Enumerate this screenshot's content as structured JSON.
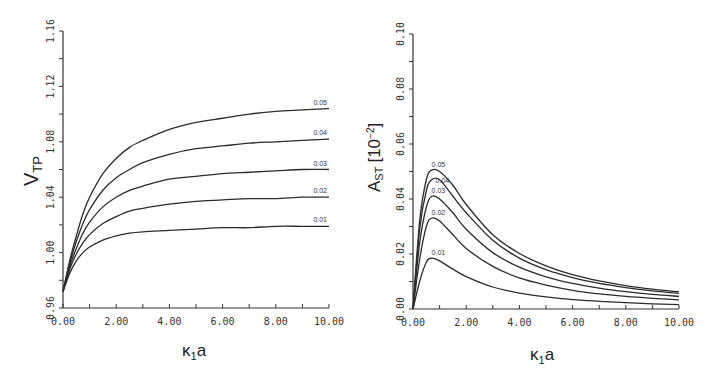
{
  "chart_data": [
    {
      "type": "line",
      "title": "",
      "xlabel": "κ1a",
      "ylabel": "VTP",
      "xlim": [
        0,
        10
      ],
      "ylim": [
        0.96,
        1.16
      ],
      "x_ticks": [
        "0.00",
        "2.00",
        "4.00",
        "6.00",
        "8.00",
        "10.00"
      ],
      "y_ticks": [
        "0.96",
        "1.00",
        "1.04",
        "1.08",
        "1.12",
        "1.16"
      ],
      "grid": false,
      "legend": "inline curve labels at right end",
      "x": [
        0,
        0.25,
        0.5,
        0.75,
        1,
        1.5,
        2,
        2.5,
        3,
        4,
        5,
        6,
        7,
        8,
        9,
        10
      ],
      "series": [
        {
          "name": "0.01",
          "values": [
            0.972,
            0.985,
            0.994,
            1.0,
            1.004,
            1.009,
            1.012,
            1.014,
            1.015,
            1.016,
            1.017,
            1.018,
            1.018,
            1.019,
            1.019,
            1.019
          ]
        },
        {
          "name": "0.02",
          "values": [
            0.972,
            0.988,
            0.999,
            1.007,
            1.013,
            1.021,
            1.026,
            1.03,
            1.032,
            1.035,
            1.037,
            1.038,
            1.039,
            1.039,
            1.04,
            1.04
          ]
        },
        {
          "name": "0.03",
          "values": [
            0.972,
            0.99,
            1.003,
            1.014,
            1.022,
            1.033,
            1.04,
            1.045,
            1.048,
            1.053,
            1.055,
            1.057,
            1.058,
            1.059,
            1.06,
            1.06
          ]
        },
        {
          "name": "0.04",
          "values": [
            0.972,
            0.992,
            1.008,
            1.021,
            1.031,
            1.045,
            1.054,
            1.06,
            1.065,
            1.071,
            1.075,
            1.077,
            1.079,
            1.08,
            1.081,
            1.082
          ]
        },
        {
          "name": "0.05",
          "values": [
            0.972,
            0.994,
            1.012,
            1.028,
            1.04,
            1.057,
            1.068,
            1.076,
            1.081,
            1.089,
            1.094,
            1.097,
            1.1,
            1.102,
            1.103,
            1.104
          ]
        }
      ]
    },
    {
      "type": "line",
      "title": "",
      "xlabel": "κ1a",
      "ylabel": "AST [10^-2]",
      "xlim": [
        0,
        10
      ],
      "ylim": [
        0,
        0.1
      ],
      "x_ticks": [
        "0.00",
        "2.00",
        "4.00",
        "6.00",
        "8.00",
        "10.00"
      ],
      "y_ticks": [
        "0.00",
        "0.02",
        "0.04",
        "0.06",
        "0.08",
        "0.10"
      ],
      "grid": false,
      "legend": "inline curve labels near peaks",
      "x": [
        0,
        0.25,
        0.5,
        0.7,
        1,
        1.5,
        2,
        3,
        4,
        5,
        6,
        7,
        8,
        9,
        10
      ],
      "series": [
        {
          "name": "0.01",
          "values": [
            0,
            0.01,
            0.017,
            0.0185,
            0.0175,
            0.0145,
            0.0118,
            0.008,
            0.0058,
            0.0044,
            0.0034,
            0.0028,
            0.0023,
            0.0019,
            0.0016
          ]
        },
        {
          "name": "0.02",
          "values": [
            0,
            0.018,
            0.03,
            0.033,
            0.032,
            0.027,
            0.022,
            0.0155,
            0.0113,
            0.0087,
            0.0068,
            0.0055,
            0.0046,
            0.0039,
            0.0033
          ]
        },
        {
          "name": "0.03",
          "values": [
            0,
            0.024,
            0.037,
            0.041,
            0.04,
            0.035,
            0.029,
            0.0205,
            0.0152,
            0.0117,
            0.0093,
            0.0076,
            0.0063,
            0.0053,
            0.0046
          ]
        },
        {
          "name": "0.04",
          "values": [
            0,
            0.029,
            0.043,
            0.047,
            0.047,
            0.041,
            0.035,
            0.025,
            0.0185,
            0.0143,
            0.0114,
            0.0093,
            0.0078,
            0.0066,
            0.0057
          ]
        },
        {
          "name": "0.05",
          "values": [
            0,
            0.032,
            0.047,
            0.0505,
            0.05,
            0.045,
            0.038,
            0.027,
            0.0202,
            0.0157,
            0.0125,
            0.0102,
            0.0085,
            0.0072,
            0.0062
          ]
        }
      ]
    }
  ],
  "left_chart": {
    "ylabel_main": "V",
    "ylabel_sub": "TP",
    "xlabel_main": "κ",
    "xlabel_sub": "1",
    "xlabel_tail": "a",
    "curve_labels": [
      "0.05",
      "0.04",
      "0.03",
      "0.02",
      "0.01"
    ]
  },
  "right_chart": {
    "ylabel_main": "A",
    "ylabel_sub": "ST",
    "ylabel_unit": "[10",
    "ylabel_exp": "−2",
    "ylabel_close": "]",
    "xlabel_main": "κ",
    "xlabel_sub": "1",
    "xlabel_tail": "a",
    "curve_labels": [
      "0.05",
      "0.04",
      "0.03",
      "0.02",
      "0.01"
    ]
  }
}
